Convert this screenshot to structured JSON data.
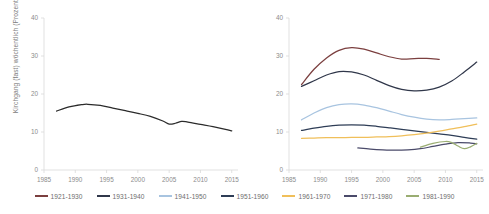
{
  "figure": {
    "background_color": "#ffffff",
    "axis_color": "#d9d9d9",
    "tick_text_color": "#8c8c8c"
  },
  "axis_label_y": "Kirchgang (fast) wöchentlich (Prozent)",
  "legend": {
    "position": "bottom",
    "items": [
      {
        "label": "1921-1930",
        "color": "#7b3f3f"
      },
      {
        "label": "1931-1940",
        "color": "#30374a"
      },
      {
        "label": "1941-1950",
        "color": "#a8c4e0"
      },
      {
        "label": "1951-1960",
        "color": "#2e3d56"
      },
      {
        "label": "1961-1970",
        "color": "#f0bf5a"
      },
      {
        "label": "1971-1980",
        "color": "#4a4a6a"
      },
      {
        "label": "1981-1990",
        "color": "#9aad72"
      }
    ]
  },
  "chart_data": [
    {
      "type": "line",
      "title": "",
      "panel": "left",
      "xlabel": "",
      "ylabel": "Kirchgang (fast) wöchentlich (Prozent)",
      "xlim": [
        1985,
        2016
      ],
      "ylim": [
        0,
        40
      ],
      "xticks": [
        1985,
        1990,
        1995,
        2000,
        2005,
        2010,
        2015
      ],
      "yticks": [
        0,
        10,
        20,
        30,
        40
      ],
      "grid": false,
      "legend": "none",
      "series": [
        {
          "name": "Gesamt",
          "color": "#2b2b2b",
          "x": [
            1987,
            1989,
            1991,
            1992,
            1994,
            1996,
            1998,
            2000,
            2002,
            2004,
            2005,
            2006,
            2007,
            2008,
            2010,
            2012,
            2014,
            2015
          ],
          "values": [
            15.5,
            16.6,
            17.2,
            17.3,
            17.0,
            16.3,
            15.6,
            14.9,
            14.1,
            12.9,
            12.1,
            12.3,
            12.8,
            12.6,
            12.0,
            11.4,
            10.7,
            10.3
          ]
        }
      ]
    },
    {
      "type": "line",
      "title": "",
      "panel": "right",
      "xlabel": "",
      "ylabel": "",
      "xlim": [
        1985,
        2016
      ],
      "ylim": [
        0,
        40
      ],
      "xticks": [
        1985,
        1990,
        1995,
        2000,
        2005,
        2010,
        2015
      ],
      "yticks": [
        0,
        10,
        20,
        30,
        40
      ],
      "grid": false,
      "legend": "bottom",
      "series": [
        {
          "name": "1921-1930",
          "color": "#7b3f3f",
          "x": [
            1987,
            1989,
            1991,
            1993,
            1995,
            1997,
            1999,
            2001,
            2003,
            2005,
            2007,
            2009
          ],
          "values": [
            22.5,
            26.5,
            29.5,
            31.5,
            32.2,
            31.8,
            30.8,
            29.8,
            29.2,
            29.3,
            29.4,
            29.1
          ]
        },
        {
          "name": "1931-1940",
          "color": "#30374a",
          "x": [
            1987,
            1989,
            1991,
            1993,
            1995,
            1997,
            1999,
            2001,
            2003,
            2005,
            2007,
            2009,
            2011,
            2013,
            2015
          ],
          "values": [
            22.0,
            23.5,
            25.0,
            25.9,
            25.8,
            25.0,
            23.6,
            22.2,
            21.2,
            20.8,
            21.0,
            21.8,
            23.4,
            25.8,
            28.4
          ]
        },
        {
          "name": "1941-1950",
          "color": "#a8c4e0",
          "x": [
            1987,
            1989,
            1991,
            1993,
            1995,
            1997,
            1999,
            2001,
            2003,
            2005,
            2007,
            2009,
            2011,
            2013,
            2015
          ],
          "values": [
            13.2,
            15.0,
            16.4,
            17.2,
            17.4,
            17.1,
            16.4,
            15.5,
            14.6,
            13.9,
            13.4,
            13.2,
            13.3,
            13.5,
            13.7
          ]
        },
        {
          "name": "1951-1960",
          "color": "#2e3d56",
          "x": [
            1987,
            1989,
            1991,
            1993,
            1995,
            1997,
            1999,
            2001,
            2003,
            2005,
            2007,
            2009,
            2011,
            2013,
            2015
          ],
          "values": [
            10.4,
            11.0,
            11.5,
            11.8,
            11.9,
            11.8,
            11.5,
            11.1,
            10.7,
            10.3,
            9.9,
            9.5,
            9.1,
            8.6,
            8.1
          ]
        },
        {
          "name": "1961-1970",
          "color": "#f0bf5a",
          "x": [
            1987,
            1989,
            1991,
            1993,
            1995,
            1997,
            1999,
            2001,
            2003,
            2005,
            2007,
            2009,
            2011,
            2013,
            2015
          ],
          "values": [
            8.3,
            8.4,
            8.5,
            8.5,
            8.6,
            8.6,
            8.7,
            8.8,
            9.0,
            9.3,
            9.7,
            10.2,
            10.8,
            11.4,
            12.1
          ]
        },
        {
          "name": "1971-1980",
          "color": "#4a4a6a",
          "x": [
            1996,
            1998,
            2000,
            2002,
            2004,
            2006,
            2008,
            2010,
            2012,
            2014,
            2015
          ],
          "values": [
            5.8,
            5.5,
            5.3,
            5.2,
            5.3,
            5.6,
            6.2,
            6.8,
            7.2,
            7.1,
            6.9
          ]
        },
        {
          "name": "1981-1990",
          "color": "#9aad72",
          "x": [
            2006,
            2008,
            2010,
            2011,
            2012,
            2013,
            2014,
            2015
          ],
          "values": [
            6.0,
            7.0,
            7.5,
            7.2,
            6.3,
            5.6,
            6.1,
            7.0
          ]
        }
      ]
    }
  ]
}
